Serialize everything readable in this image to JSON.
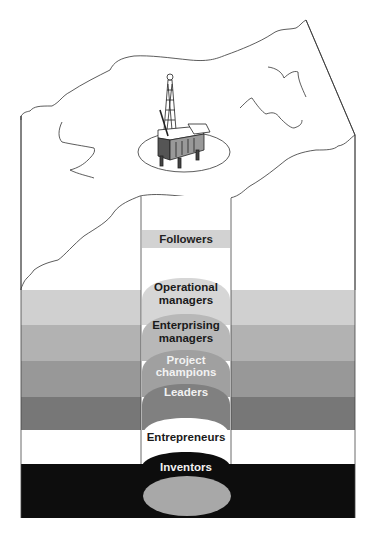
{
  "diagram": {
    "title": "",
    "surface": {
      "icon": "oil-rig-icon",
      "description": "Oil rig on terrain surface"
    },
    "layers": [
      {
        "label": "Followers",
        "band_color": "#d2d2d2",
        "text_color": "#222222"
      },
      {
        "label": "Operational managers",
        "line1": "Operational",
        "line2": "managers",
        "band_color": "#d0d0d0",
        "dome_color": "#d6d6d6",
        "text_color": "#1a1a1a"
      },
      {
        "label": "Enterprising managers",
        "line1": "Enterprising",
        "line2": "managers",
        "band_color": "#b2b2b2",
        "dome_color": "#b8b8b8",
        "text_color": "#1a1a1a"
      },
      {
        "label": "Project champions",
        "line1": "Project",
        "line2": "champions",
        "band_color": "#989898",
        "dome_color": "#a0a0a0",
        "text_color": "#f2f2f2"
      },
      {
        "label": "Leaders",
        "band_color": "#777777",
        "dome_color": "#808080",
        "text_color": "#f2f2f2"
      },
      {
        "label": "Entrepreneurs",
        "band_color": "#ffffff",
        "dome_color": "#ffffff",
        "text_color": "#1a1a1a"
      },
      {
        "label": "Inventors",
        "band_color": "#0d0d0d",
        "dome_color": "#0d0d0d",
        "text_color": "#f2f2f2",
        "core_color": "#a8a8a8"
      }
    ]
  }
}
